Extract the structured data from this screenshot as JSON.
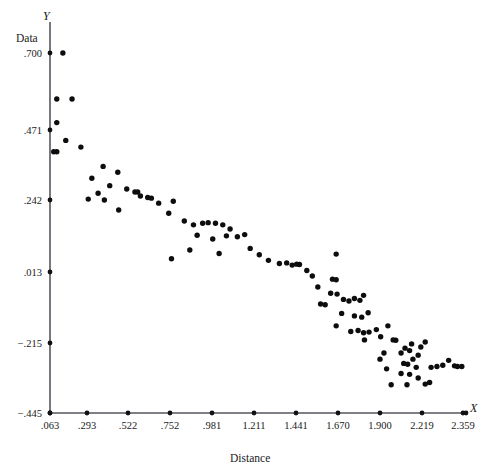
{
  "chart_data": {
    "type": "scatter",
    "title": "",
    "xlabel": "Distance",
    "ylabel": "Data",
    "x_axis_symbol": "X",
    "y_axis_symbol": "Y",
    "xlim": [
      0.063,
      2.359
    ],
    "ylim": [
      -0.445,
      0.7
    ],
    "grid": false,
    "legend": "none",
    "xticks": [
      0.063,
      0.293,
      0.522,
      0.752,
      0.981,
      1.211,
      1.441,
      1.67,
      1.9,
      2.219,
      2.359
    ],
    "xtick_labels": [
      ".063",
      ".293",
      ".522",
      ".752",
      ".981",
      "1.211",
      "1.441",
      "1.670",
      "1.900",
      "2.219",
      "2.359"
    ],
    "xtick_positions_px": [
      50,
      87,
      128,
      170,
      212,
      254,
      296,
      338,
      380,
      422,
      463
    ],
    "yticks": [
      0.7,
      0.471,
      0.242,
      0.013,
      -0.215,
      -0.445
    ],
    "ytick_labels": [
      ".700",
      ".471",
      ".242",
      ".013",
      "−.215",
      "−.445"
    ],
    "ytick_positions_px": [
      53,
      130,
      200,
      272,
      343,
      413
    ],
    "points": [
      [
        0.143,
        0.7
      ],
      [
        0.105,
        0.563
      ],
      [
        0.2,
        0.563
      ],
      [
        0.105,
        0.493
      ],
      [
        0.161,
        0.437
      ],
      [
        0.086,
        0.4
      ],
      [
        0.105,
        0.4
      ],
      [
        0.383,
        0.352
      ],
      [
        0.32,
        0.313
      ],
      [
        0.255,
        0.415
      ],
      [
        0.465,
        0.333
      ],
      [
        0.355,
        0.264
      ],
      [
        0.42,
        0.289
      ],
      [
        0.515,
        0.278
      ],
      [
        0.56,
        0.268
      ],
      [
        0.575,
        0.268
      ],
      [
        0.59,
        0.255
      ],
      [
        0.63,
        0.25
      ],
      [
        0.65,
        0.248
      ],
      [
        0.69,
        0.232
      ],
      [
        0.47,
        0.21
      ],
      [
        0.3,
        0.245
      ],
      [
        0.39,
        0.242
      ],
      [
        0.77,
        0.238
      ],
      [
        0.745,
        0.2
      ],
      [
        0.83,
        0.175
      ],
      [
        0.88,
        0.163
      ],
      [
        0.93,
        0.168
      ],
      [
        0.96,
        0.17
      ],
      [
        1.0,
        0.168
      ],
      [
        1.04,
        0.163
      ],
      [
        1.08,
        0.15
      ],
      [
        0.9,
        0.13
      ],
      [
        0.985,
        0.118
      ],
      [
        1.06,
        0.128
      ],
      [
        1.12,
        0.125
      ],
      [
        1.16,
        0.132
      ],
      [
        0.86,
        0.083
      ],
      [
        1.02,
        0.072
      ],
      [
        1.19,
        0.088
      ],
      [
        0.76,
        0.055
      ],
      [
        1.29,
        0.05
      ],
      [
        1.39,
        0.042
      ],
      [
        1.42,
        0.035
      ],
      [
        1.445,
        0.038
      ],
      [
        1.46,
        0.037
      ],
      [
        1.5,
        0.018
      ],
      [
        1.53,
        0.0
      ],
      [
        1.56,
        -0.035
      ],
      [
        1.66,
        0.07
      ],
      [
        1.64,
        -0.01
      ],
      [
        1.66,
        -0.012
      ],
      [
        1.63,
        -0.055
      ],
      [
        1.665,
        -0.058
      ],
      [
        1.7,
        -0.075
      ],
      [
        1.73,
        -0.08
      ],
      [
        1.76,
        -0.072
      ],
      [
        1.79,
        -0.078
      ],
      [
        1.81,
        -0.062
      ],
      [
        1.69,
        -0.12
      ],
      [
        1.76,
        -0.128
      ],
      [
        1.8,
        -0.132
      ],
      [
        1.835,
        -0.118
      ],
      [
        1.66,
        -0.16
      ],
      [
        1.74,
        -0.178
      ],
      [
        1.78,
        -0.175
      ],
      [
        1.81,
        -0.182
      ],
      [
        1.84,
        -0.18
      ],
      [
        1.88,
        -0.172
      ],
      [
        1.815,
        -0.205
      ],
      [
        1.905,
        -0.195
      ],
      [
        1.96,
        -0.16
      ],
      [
        2.0,
        -0.205
      ],
      [
        2.02,
        -0.206
      ],
      [
        1.93,
        -0.248
      ],
      [
        2.06,
        -0.248
      ],
      [
        2.09,
        -0.232
      ],
      [
        2.125,
        -0.24
      ],
      [
        2.14,
        -0.218
      ],
      [
        2.08,
        -0.282
      ],
      [
        2.11,
        -0.285
      ],
      [
        2.15,
        -0.268
      ],
      [
        2.19,
        -0.255
      ],
      [
        2.175,
        -0.295
      ],
      [
        2.21,
        -0.228
      ],
      [
        2.23,
        -0.212
      ],
      [
        2.06,
        -0.315
      ],
      [
        2.125,
        -0.318
      ],
      [
        2.19,
        -0.33
      ],
      [
        2.25,
        -0.295
      ],
      [
        2.27,
        -0.292
      ],
      [
        2.29,
        -0.288
      ],
      [
        2.31,
        -0.272
      ],
      [
        2.33,
        -0.29
      ],
      [
        2.34,
        -0.292
      ],
      [
        2.355,
        -0.292
      ],
      [
        1.985,
        -0.352
      ],
      [
        2.105,
        -0.352
      ],
      [
        2.245,
        -0.345
      ],
      [
        1.24,
        0.068
      ],
      [
        1.35,
        0.04
      ],
      [
        1.575,
        -0.09
      ],
      [
        1.6,
        -0.092
      ],
      [
        1.9,
        -0.268
      ],
      [
        1.95,
        -0.3
      ],
      [
        2.23,
        -0.35
      ]
    ]
  }
}
